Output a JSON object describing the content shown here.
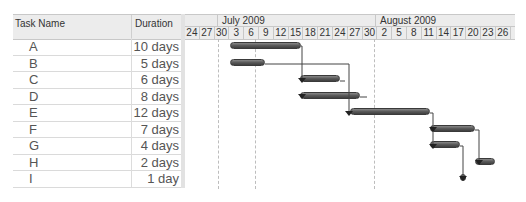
{
  "table": {
    "headers": {
      "task_name": "Task Name",
      "duration": "Duration"
    },
    "rows": [
      {
        "name": "A",
        "duration": "10 days"
      },
      {
        "name": "B",
        "duration": "5 days"
      },
      {
        "name": "C",
        "duration": "6 days"
      },
      {
        "name": "D",
        "duration": "8 days"
      },
      {
        "name": "E",
        "duration": "12 days"
      },
      {
        "name": "F",
        "duration": "7 days"
      },
      {
        "name": "G",
        "duration": "4 days"
      },
      {
        "name": "H",
        "duration": "2 days"
      },
      {
        "name": "I",
        "duration": "1 day"
      }
    ]
  },
  "timeline": {
    "months": [
      {
        "label": "July 2009"
      },
      {
        "label": "August 2009"
      }
    ],
    "days": [
      "24",
      "27",
      "30",
      "3",
      "6",
      "9",
      "12",
      "15",
      "18",
      "21",
      "24",
      "27",
      "30",
      "2",
      "5",
      "8",
      "11",
      "14",
      "17",
      "20",
      "23",
      "26"
    ]
  },
  "bars": [
    {
      "task": "A",
      "x1": 45,
      "x2": 116
    },
    {
      "task": "B",
      "x1": 45,
      "x2": 80
    },
    {
      "task": "C",
      "x1": 115,
      "x2": 155
    },
    {
      "task": "D",
      "x1": 115,
      "x2": 175
    },
    {
      "task": "E",
      "x1": 165,
      "x2": 245
    },
    {
      "task": "F",
      "x1": 245,
      "x2": 290
    },
    {
      "task": "G",
      "x1": 245,
      "x2": 275
    },
    {
      "task": "H",
      "x1": 290,
      "x2": 310
    },
    {
      "task": "I",
      "x1": 275,
      "x2": 281
    }
  ],
  "colors": {
    "bar": "#555555",
    "header_bg": "#ececec",
    "grid": "#c8c8c8"
  }
}
